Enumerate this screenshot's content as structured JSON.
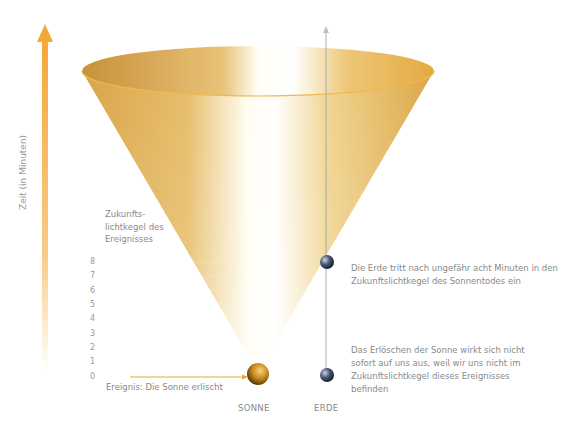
{
  "axis": {
    "label": "Zeit (in Minuten)",
    "ticks": [
      "0",
      "1",
      "2",
      "3",
      "4",
      "5",
      "6",
      "7",
      "8"
    ],
    "arrow_color": "#f5a83a"
  },
  "cone": {
    "label_lines": [
      "Zukunfts-",
      "lichtkegel des",
      "Ereignisses"
    ],
    "color": "#e2b256",
    "highlight": "#ffffff"
  },
  "event": {
    "label": "Ereignis: Die Sonne erlischt"
  },
  "objects": {
    "sun": {
      "label": "SONNE",
      "color": "#c9891c"
    },
    "earth": {
      "label": "ERDE",
      "color": "#2b3350"
    }
  },
  "notes": [
    {
      "text": "Die Erde tritt nach ungefähr acht Minuten in den Zukunftslichtkegel des Sonnentodes ein"
    },
    {
      "text": "Das Erlöschen der Sonne wirkt sich nicht sofort auf uns aus, weil wir uns nicht im Zukunftslichtkegel dieses Ereignisses befinden"
    }
  ]
}
